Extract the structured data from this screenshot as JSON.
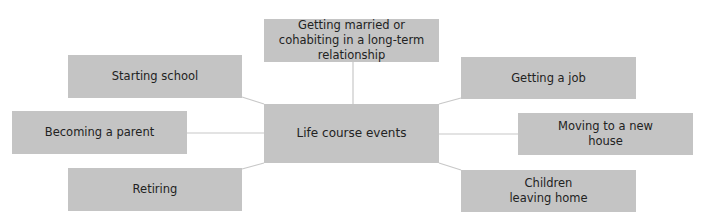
{
  "diagram": {
    "center": {
      "label": "Life course events"
    },
    "nodes": [
      {
        "id": "married",
        "label": "Getting married or cohabiting in a long-term relationship"
      },
      {
        "id": "school",
        "label": "Starting school"
      },
      {
        "id": "parent",
        "label": "Becoming a parent"
      },
      {
        "id": "retiring",
        "label": "Retiring"
      },
      {
        "id": "job",
        "label": "Getting a job"
      },
      {
        "id": "moving",
        "label": "Moving to a new house"
      },
      {
        "id": "children",
        "label": "Children leaving home"
      }
    ],
    "colors": {
      "box": "#c4c4c4",
      "line": "#c8c8c8",
      "text": "#222222"
    }
  }
}
